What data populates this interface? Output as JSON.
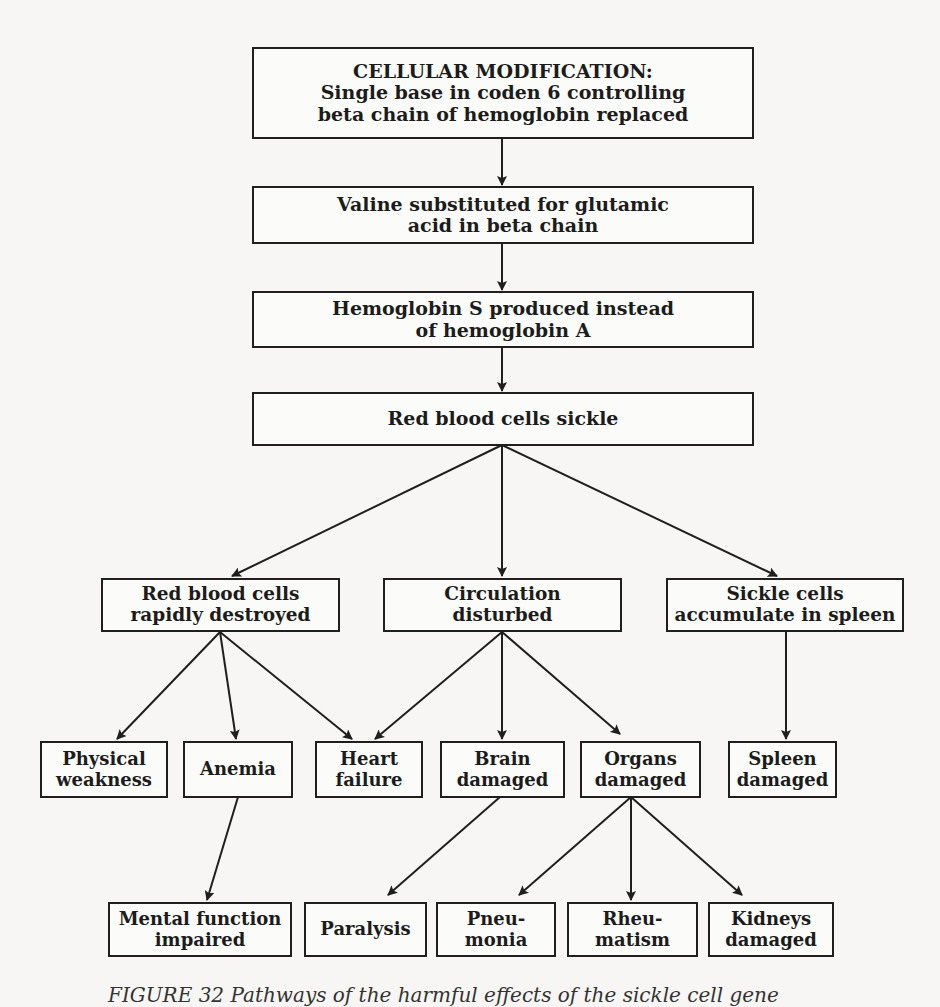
{
  "diagram": {
    "type": "flowchart",
    "nodes": {
      "n1": {
        "lines": [
          "CELLULAR MODIFICATION:",
          "Single base in coden 6 controlling",
          "beta chain of hemoglobin replaced"
        ]
      },
      "n2": {
        "lines": [
          "Valine substituted for glutamic",
          "acid in beta chain"
        ]
      },
      "n3": {
        "lines": [
          "Hemoglobin S produced instead",
          "of hemoglobin A"
        ]
      },
      "n4": {
        "lines": [
          "Red blood cells sickle"
        ]
      },
      "n5": {
        "lines": [
          "Red blood cells",
          "rapidly destroyed"
        ]
      },
      "n6": {
        "lines": [
          "Circulation",
          "disturbed"
        ]
      },
      "n7": {
        "lines": [
          "Sickle cells",
          "accumulate in spleen"
        ]
      },
      "n8": {
        "lines": [
          "Physical",
          "weakness"
        ]
      },
      "n9": {
        "lines": [
          "Anemia"
        ]
      },
      "n10": {
        "lines": [
          "Heart",
          "failure"
        ]
      },
      "n11": {
        "lines": [
          "Brain",
          "damaged"
        ]
      },
      "n12": {
        "lines": [
          "Organs",
          "damaged"
        ]
      },
      "n13": {
        "lines": [
          "Spleen",
          "damaged"
        ]
      },
      "n14": {
        "lines": [
          "Mental function",
          "impaired"
        ]
      },
      "n15": {
        "lines": [
          "Paralysis"
        ]
      },
      "n16": {
        "lines": [
          "Pneu-",
          "monia"
        ]
      },
      "n17": {
        "lines": [
          "Rheu-",
          "matism"
        ]
      },
      "n18": {
        "lines": [
          "Kidneys",
          "damaged"
        ]
      }
    },
    "edges": [
      [
        "n1",
        "n2"
      ],
      [
        "n2",
        "n3"
      ],
      [
        "n3",
        "n4"
      ],
      [
        "n4",
        "n5"
      ],
      [
        "n4",
        "n6"
      ],
      [
        "n4",
        "n7"
      ],
      [
        "n5",
        "n8"
      ],
      [
        "n5",
        "n9"
      ],
      [
        "n5",
        "n10"
      ],
      [
        "n6",
        "n10"
      ],
      [
        "n6",
        "n11"
      ],
      [
        "n6",
        "n12"
      ],
      [
        "n7",
        "n13"
      ],
      [
        "n9",
        "n14"
      ],
      [
        "n11",
        "n15"
      ],
      [
        "n12",
        "n16"
      ],
      [
        "n12",
        "n17"
      ],
      [
        "n12",
        "n18"
      ]
    ],
    "caption": "FIGURE 32 Pathways of the harmful effects of the sickle cell gene"
  },
  "colors": {
    "line": "#1f1f1f",
    "background": "#f7f6f4"
  }
}
